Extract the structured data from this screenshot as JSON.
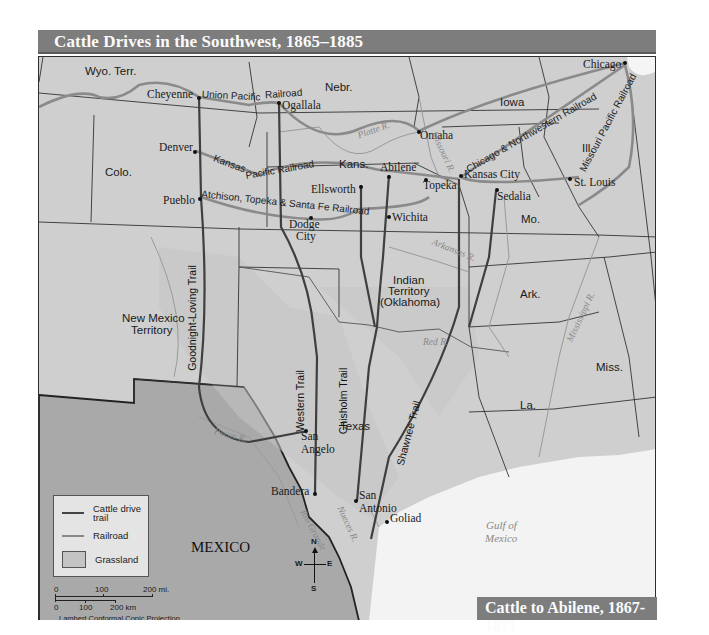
{
  "title": "Cattle Drives in the Southwest, 1865–1885",
  "inset_title": "Cattle to Abilene, 1867-1871",
  "colors": {
    "title_bar": "#7d7d7d",
    "land": "#cfcfcf",
    "grassland": "#c4c4c4",
    "mexico": "#a9a9a9",
    "water": "#f3f3f3",
    "trail": "#444444",
    "railroad": "#888888",
    "river": "#999999"
  },
  "states": {
    "wyo": "Wyo. Terr.",
    "nebr": "Nebr.",
    "iowa": "Iowa",
    "ill": "Ill.",
    "colo": "Colo.",
    "kans": "Kans.",
    "mo": "Mo.",
    "indian_1": "Indian",
    "indian_2": "Territory",
    "indian_3": "(Oklahoma)",
    "nm_1": "New Mexico",
    "nm_2": "Territory",
    "ark": "Ark.",
    "texas": "Texas",
    "miss": "Miss.",
    "la": "La.",
    "mexico": "MEXICO"
  },
  "cities": {
    "cheyenne": "Cheyenne",
    "ogallala": "Ogallala",
    "omaha": "Omaha",
    "chicago": "Chicago",
    "denver": "Denver",
    "ellsworth": "Ellsworth",
    "abilene": "Abilene",
    "topeka": "Topeka",
    "kansas_city": "Kansas City",
    "st_louis": "St. Louis",
    "pueblo": "Pueblo",
    "dodge_1": "Dodge",
    "dodge_2": "City",
    "wichita": "Wichita",
    "sedalia": "Sedalia",
    "san_angelo_1": "San",
    "san_angelo_2": "Angelo",
    "bandera": "Bandera",
    "san_antonio_1": "San",
    "san_antonio_2": "Antonio",
    "goliad": "Goliad"
  },
  "railroads": {
    "union_pacific_1": "Union Pacific",
    "union_pacific_2": "Railroad",
    "kansas_pacific_1": "Kansas",
    "kansas_pacific_2": "Pacific Railroad",
    "atchison": "Atchison, Topeka & Santa Fe Railroad",
    "chicago_nw": "Chicago & Northwestern Railroad",
    "missouri_pacific": "Missouri Pacific Railroad"
  },
  "trails": {
    "goodnight": "Goodnight-Loving Trail",
    "western": "Western Trail",
    "chisholm": "Chisholm Trail",
    "shawnee": "Shawnee Trail"
  },
  "rivers": {
    "platte": "Platte R.",
    "missouri": "Missouri R.",
    "arkansas": "Arkansas R.",
    "red": "Red R.",
    "mississippi": "Mississippi R.",
    "pecos": "Pecos R.",
    "nueces": "Nueces R.",
    "rio_grande": "Rio Grande"
  },
  "water": {
    "gulf_1": "Gulf of",
    "gulf_2": "Mexico"
  },
  "legend": {
    "trail": "Cattle drive trail",
    "railroad": "Railroad",
    "grassland": "Grassland"
  },
  "scale": {
    "mi_0": "0",
    "mi_100": "100",
    "mi_200": "200 mi.",
    "km_0": "0",
    "km_100": "100",
    "km_200": "200 km",
    "projection": "Lambert Conformal Conic Projection"
  },
  "compass": {
    "n": "N",
    "s": "S",
    "e": "E",
    "w": "W"
  }
}
